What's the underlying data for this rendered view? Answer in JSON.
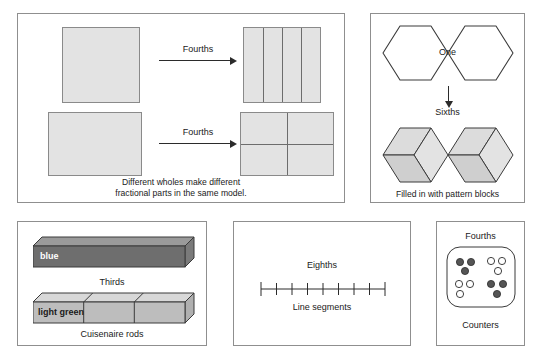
{
  "figure": {
    "background_color": "#ffffff",
    "fill_gray": "#e3e3e3",
    "stroke_gray": "#8a8a8a",
    "rod_blue_color": "#6e6e6e",
    "rod_green_color": "#bdbdbd",
    "counter_dark_color": "#555555",
    "counter_light_color": "#ffffff"
  },
  "panels": {
    "area_model": {
      "name": "Area model panel",
      "arrow_label_top": "Fourths",
      "arrow_label_bottom": "Fourths",
      "caption_line1": "Different wholes make different",
      "caption_line2": "fractional parts in the same model.",
      "top_shape": "square",
      "top_partitions": 4,
      "top_partition_style": "vertical strips",
      "bottom_shape": "rectangle",
      "bottom_partitions": 4,
      "bottom_partition_style": "2 by 2 grid"
    },
    "pattern_blocks": {
      "name": "Pattern block panel",
      "whole_label": "One",
      "arrow_label": "Sixths",
      "caption": "Filled in with pattern blocks",
      "whole_shape": "two joined hexagons",
      "partitions": 6,
      "partition_style": "rhombi (3 per hexagon)"
    },
    "cuisenaire": {
      "name": "Cuisenaire rods panel",
      "top_rod_label": "blue",
      "middle_label": "Thirds",
      "bottom_rod_label": "light green",
      "caption": "Cuisenaire rods",
      "partitions": 3
    },
    "line_segments": {
      "name": "Line segment panel",
      "top_label": "Eighths",
      "caption": "Line segments",
      "tick_count": 9,
      "interval_count": 8
    },
    "counters": {
      "name": "Counters panel",
      "top_label": "Fourths",
      "caption": "Counters",
      "group_count": 4,
      "counters_per_group": 3,
      "total_counters": 12,
      "groups": [
        {
          "position": "top-left",
          "style": "dark"
        },
        {
          "position": "top-right",
          "style": "light"
        },
        {
          "position": "bottom-left",
          "style": "light"
        },
        {
          "position": "bottom-right",
          "style": "dark"
        }
      ]
    }
  }
}
